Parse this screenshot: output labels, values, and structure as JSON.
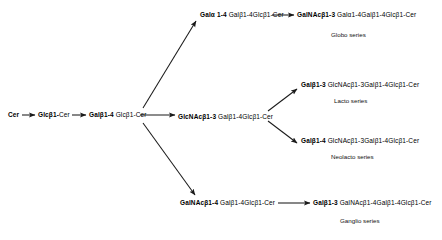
{
  "diagram": {
    "width": 442,
    "height": 240,
    "background": "#ffffff",
    "line_color": "#1a1a1a"
  },
  "nodes": {
    "ceramide": {
      "head": "Cer",
      "tail": "",
      "x": 8,
      "y": 112
    },
    "glucosylceramide": {
      "head": "Glcβ1-",
      "tail": "Cer",
      "x": 38,
      "y": 112
    },
    "lactosylceramide": {
      "head": "Galβ1-4",
      "tail": " Glcβ1-Cer",
      "x": 89,
      "y": 112
    },
    "globotriaosylceramide": {
      "head": "Galα 1-4",
      "tail": " Galβ1-4Glcβ1-Cer",
      "x": 200,
      "y": 12
    },
    "globoside": {
      "head": "GalNAcβ1-3",
      "tail": " Galα1-4Galβ1-4Glcβ1-Cer",
      "x": 297,
      "y": 12
    },
    "lactotriaosylceramide": {
      "head": "GlcNAcβ1-3",
      "tail": " Galβ1-4Glcβ1-Cer",
      "x": 178,
      "y": 114
    },
    "lactotetraosylceramide": {
      "head": "Galβ1-3",
      "tail": " GlcNAcβ1-3Galβ1-4Glcβ1-Cer",
      "x": 301,
      "y": 82
    },
    "neolactotetraosylceramide": {
      "head": "Galβ1-4",
      "tail": " GlcNAcβ1-3Galβ1-4Glcβ1-Cer",
      "x": 301,
      "y": 138
    },
    "gangliotriaosylceramide": {
      "head": "GalNAcβ1-4",
      "tail": " Galβ1-4Glcβ1-Cer",
      "x": 180,
      "y": 200
    },
    "gangliotetraosylceramide": {
      "head": "Galβ1-3",
      "tail": " GalNAcβ1-4Galβ1-4Glcβ1-Cer",
      "x": 313,
      "y": 200
    }
  },
  "captions": {
    "globo": {
      "label": "Globo series",
      "x": 331,
      "y": 32
    },
    "lacto": {
      "label": "Lacto series",
      "x": 334,
      "y": 98
    },
    "neolacto": {
      "label": "Neolacto series",
      "x": 331,
      "y": 154
    },
    "ganglio": {
      "label": "Ganglio series",
      "x": 340,
      "y": 218
    }
  },
  "edges": [
    {
      "name": "cer-to-glccer",
      "x1": 22,
      "y1": 115,
      "x2": 36,
      "y2": 115
    },
    {
      "name": "glccer-to-laccer",
      "x1": 72,
      "y1": 115,
      "x2": 87,
      "y2": 115
    },
    {
      "name": "laccer-to-lc3cer",
      "x1": 139,
      "y1": 115,
      "x2": 176,
      "y2": 115
    },
    {
      "name": "laccer-to-gb3cer",
      "x1": 143,
      "y1": 108,
      "x2": 197,
      "y2": 20
    },
    {
      "name": "laccer-to-gg3cer",
      "x1": 143,
      "y1": 123,
      "x2": 196,
      "y2": 196
    },
    {
      "name": "lc3cer-to-lc4cer",
      "x1": 268,
      "y1": 110,
      "x2": 298,
      "y2": 88
    },
    {
      "name": "lc3cer-to-nlc4cer",
      "x1": 268,
      "y1": 122,
      "x2": 298,
      "y2": 144
    },
    {
      "name": "gb3cer-to-gb4cer",
      "x1": 272,
      "y1": 15,
      "x2": 295,
      "y2": 15
    },
    {
      "name": "gg3cer-to-gg4cer",
      "x1": 278,
      "y1": 203,
      "x2": 311,
      "y2": 203
    }
  ]
}
